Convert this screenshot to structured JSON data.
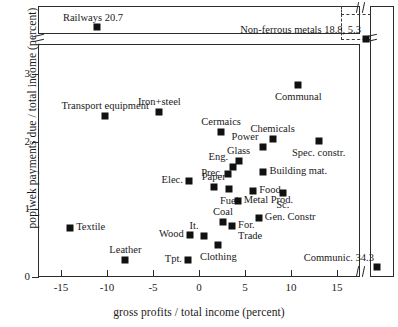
{
  "chart_data": {
    "type": "scatter",
    "title": "",
    "xlabel": "gross profits / total income (percent)",
    "ylabel": "popiwek payments due / total income (percent)",
    "xlim": [
      -17.5,
      17.5
    ],
    "ylim": [
      0,
      3.45
    ],
    "xticks": [
      -15,
      -10,
      -5,
      0,
      5,
      10,
      15
    ],
    "yticks": [
      0,
      1,
      2,
      3
    ],
    "grid": false,
    "legend": "none",
    "axis_breaks": {
      "x_break_after": 15,
      "y_break_above": 3,
      "note": "both axes broken to show far off-scale observations"
    },
    "points": [
      {
        "label": "Railways 20.7",
        "x": -11.5,
        "y": 3.9,
        "offscale": true,
        "label_pos": "above-left"
      },
      {
        "label": "Non-ferrous metals 18.8, 5.3",
        "x": 18.8,
        "y": 5.3,
        "offscale": true,
        "label_pos": "left"
      },
      {
        "label": "Communic. 34.3",
        "x": 34.3,
        "y": 0.18,
        "offscale": true,
        "label_pos": "above-left"
      },
      {
        "label": "Transport equipment",
        "x": -10.2,
        "y": 2.38,
        "label_pos": "above-center"
      },
      {
        "label": "Iron+steel",
        "x": -4.3,
        "y": 2.45,
        "label_pos": "above-center"
      },
      {
        "label": "Cermaics",
        "x": 2.4,
        "y": 2.15,
        "label_pos": "above-center"
      },
      {
        "label": "Communal",
        "x": 10.8,
        "y": 2.85,
        "label_pos": "below-center"
      },
      {
        "label": "Chemicals",
        "x": 8.0,
        "y": 2.05,
        "label_pos": "above-center"
      },
      {
        "label": "Power",
        "x": 7.0,
        "y": 1.92,
        "label_pos": "above-left"
      },
      {
        "label": "Spec. constr.",
        "x": 13.0,
        "y": 2.02,
        "label_pos": "below-center"
      },
      {
        "label": "Glass",
        "x": 4.3,
        "y": 1.72,
        "label_pos": "above-center"
      },
      {
        "label": "Eng.",
        "x": 3.7,
        "y": 1.63,
        "label_pos": "above-left"
      },
      {
        "label": "Prec.",
        "x": 3.2,
        "y": 1.52,
        "label_pos": "left"
      },
      {
        "label": "Building mat.",
        "x": 7.0,
        "y": 1.55,
        "label_pos": "right"
      },
      {
        "label": "Sc.",
        "x": 9.1,
        "y": 1.25,
        "label_pos": "below-center"
      },
      {
        "label": "Paper",
        "x": 1.6,
        "y": 1.34,
        "label_pos": "below-left"
      },
      {
        "label": "Fuel",
        "x": 3.3,
        "y": 1.3,
        "label_pos": "below-center"
      },
      {
        "label": "Food",
        "x": 5.9,
        "y": 1.28,
        "label_pos": "right"
      },
      {
        "label": "Metal Prod.",
        "x": 4.2,
        "y": 1.12,
        "label_pos": "right"
      },
      {
        "label": "Elec.",
        "x": -1.1,
        "y": 1.42,
        "label_pos": "left"
      },
      {
        "label": "Coal",
        "x": 2.6,
        "y": 0.82,
        "label_pos": "above-center"
      },
      {
        "label": "Gen. Constr",
        "x": 6.5,
        "y": 0.88,
        "label_pos": "right"
      },
      {
        "label": "For.",
        "x": 3.6,
        "y": 0.75,
        "label_pos": "right"
      },
      {
        "label": "Trade",
        "x": 3.6,
        "y": 0.75,
        "label_pos": "below-right"
      },
      {
        "label": "It.",
        "x": 0.5,
        "y": 0.6,
        "label_pos": "above-left"
      },
      {
        "label": "Clothing",
        "x": 2.1,
        "y": 0.48,
        "label_pos": "below-center"
      },
      {
        "label": "Wood",
        "x": -1.0,
        "y": 0.62,
        "label_pos": "left"
      },
      {
        "label": "Tpt.",
        "x": -1.2,
        "y": 0.25,
        "label_pos": "left"
      },
      {
        "label": "Textile",
        "x": -14.0,
        "y": 0.72,
        "label_pos": "right"
      },
      {
        "label": "Leather",
        "x": -8.0,
        "y": 0.25,
        "label_pos": "above-center"
      }
    ]
  },
  "axis": {
    "ylabel": "popiwek payments due / total income (percent)",
    "xlabel": "gross profits / total income (percent)",
    "yticklabels": [
      "0",
      "1",
      "2",
      "3"
    ],
    "xticklabels": [
      "-15",
      "-10",
      "-5",
      "0",
      "5",
      "10",
      "15"
    ]
  },
  "annotations": {
    "railways": "Railways 20.7",
    "nonferrous": "Non-ferrous metals 18.8, 5.3",
    "communic": "Communic. 34.3"
  }
}
